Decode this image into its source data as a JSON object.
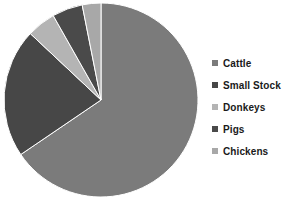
{
  "chart_data": {
    "type": "pie",
    "title": "",
    "subtitle": "",
    "xlabel": "",
    "ylabel": "",
    "grid": false,
    "legend_position": "right",
    "start_angle_deg": 0,
    "direction": "clockwise",
    "categories": [
      "Cattle",
      "Small Stock",
      "Donkeys",
      "Pigs",
      "Chickens"
    ],
    "values": [
      65.5,
      21.5,
      4.8,
      5.1,
      3.1
    ],
    "units": "percent",
    "colors": [
      "#7b7b7b",
      "#474747",
      "#b4b4b4",
      "#4a4a4a",
      "#a8a8a8"
    ],
    "slices": [
      {
        "label": "Cattle",
        "value": 65.5,
        "color": "#7b7b7b",
        "start_deg": 0.0,
        "end_deg": 235.8
      },
      {
        "label": "Small Stock",
        "value": 21.5,
        "color": "#474747",
        "start_deg": 235.8,
        "end_deg": 313.2
      },
      {
        "label": "Donkeys",
        "value": 4.8,
        "color": "#b4b4b4",
        "start_deg": 313.2,
        "end_deg": 330.5
      },
      {
        "label": "Pigs",
        "value": 5.1,
        "color": "#4a4a4a",
        "start_deg": 330.5,
        "end_deg": 348.8
      },
      {
        "label": "Chickens",
        "value": 3.1,
        "color": "#a8a8a8",
        "start_deg": 348.8,
        "end_deg": 360.0
      }
    ]
  },
  "legend": {
    "items": [
      {
        "label": "Cattle",
        "color": "#7b7b7b"
      },
      {
        "label": "Small Stock",
        "color": "#474747"
      },
      {
        "label": "Donkeys",
        "color": "#b4b4b4"
      },
      {
        "label": "Pigs",
        "color": "#4a4a4a"
      },
      {
        "label": "Chickens",
        "color": "#a8a8a8"
      }
    ]
  },
  "pie_geometry": {
    "cx": 101,
    "cy": 100,
    "r": 97
  }
}
